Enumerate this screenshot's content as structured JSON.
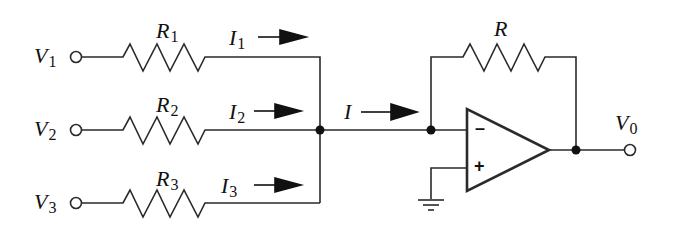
{
  "diagram": {
    "inputs": [
      {
        "voltage": "V",
        "voltage_sub": "1",
        "resistor": "R",
        "resistor_sub": "1",
        "current": "I",
        "current_sub": "1"
      },
      {
        "voltage": "V",
        "voltage_sub": "2",
        "resistor": "R",
        "resistor_sub": "2",
        "current": "I",
        "current_sub": "2"
      },
      {
        "voltage": "V",
        "voltage_sub": "3",
        "resistor": "R",
        "resistor_sub": "3",
        "current": "I",
        "current_sub": "3"
      }
    ],
    "sum_current": "I",
    "feedback_resistor": "R",
    "output": {
      "voltage": "V",
      "voltage_sub": "0"
    },
    "opamp": {
      "inverting_sign": "–",
      "noninverting_sign": "+"
    },
    "colors": {
      "line": "#2a2a2a",
      "fill": "#111111",
      "background": "#ffffff"
    }
  }
}
